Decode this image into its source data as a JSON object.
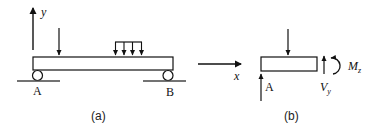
{
  "diagram": {
    "panel_a": {
      "caption": "(a)",
      "axis_y_label": "y",
      "axis_x_label": "x",
      "support_left_label": "A",
      "support_right_label": "B",
      "point_load_count": 1,
      "distributed_load_arrow_count": 4
    },
    "panel_b": {
      "caption": "(b)",
      "reaction_label": "A",
      "shear_label_main": "V",
      "shear_label_sub": "y",
      "moment_label_main": "M",
      "moment_label_sub": "z"
    },
    "colors": {
      "stroke": "#111111",
      "ground": "#444444",
      "background": "#ffffff"
    }
  }
}
